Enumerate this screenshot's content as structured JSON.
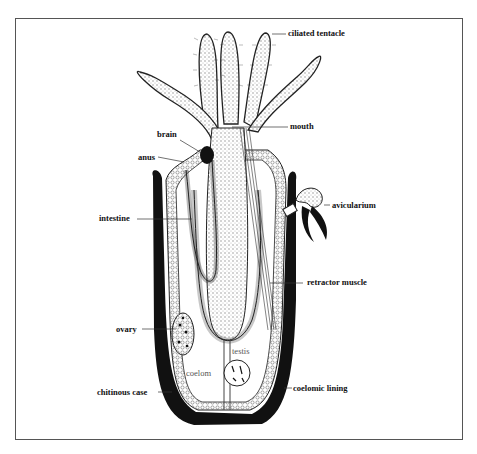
{
  "diagram": {
    "labels": {
      "ciliated_tentacle": "ciliated tentacle",
      "mouth": "mouth",
      "brain": "brain",
      "anus": "anus",
      "avicularium": "avicularium",
      "intestine": "intestine",
      "retractor_muscle": "retractor muscle",
      "ovary": "ovary",
      "testis": "testis",
      "coelom": "coelom",
      "chitinous_case": "chitinous case",
      "coelomic_lining": "coelomic lining"
    },
    "colors": {
      "ink": "#111111",
      "stipple": "#d8d8d8",
      "background": "#ffffff",
      "frame": "#555555"
    }
  }
}
